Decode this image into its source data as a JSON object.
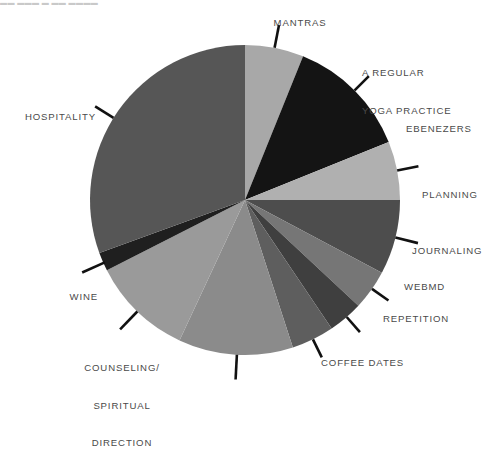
{
  "page": {
    "cut_off_header": "▬▬  ▬▬▬ ▬ ▬▬ ▬▬▬▬"
  },
  "chart_data": {
    "type": "pie",
    "title": "",
    "subtitle": "",
    "xlabel": "",
    "ylabel": "",
    "grid": false,
    "legend_position": "callout-labels",
    "start_angle_deg": 0,
    "direction": "clockwise",
    "center": {
      "x": 245,
      "y": 200
    },
    "radius": 155,
    "categories": [
      "MANTRAS",
      "A REGULAR YOGA PRACTICE",
      "EBENEZERS",
      "PLANNING",
      "JOURNALING",
      "WEBMD",
      "REPETITION",
      "COFFEE DATES",
      "COUNSELING/ SPIRITUAL DIRECTION",
      "WINE",
      "HOSPITALITY"
    ],
    "values": [
      6.1,
      12.8,
      6.1,
      7.8,
      4.2,
      3.6,
      4.4,
      11.9,
      10.6,
      2.0,
      30.5
    ],
    "colors": [
      "#a8a8a8",
      "#141414",
      "#b0b0b0",
      "#4d4d4d",
      "#767676",
      "#3f3f3f",
      "#5e5e5e",
      "#8b8b8b",
      "#9a9a9a",
      "#1f1f1f",
      "#565656"
    ],
    "slices": [
      {
        "label": "MANTRAS",
        "value": 6.1,
        "start_deg": 0.0,
        "end_deg": 22.0,
        "color": "#a8a8a8"
      },
      {
        "label": "A REGULAR YOGA PRACTICE",
        "value": 12.8,
        "start_deg": 22.0,
        "end_deg": 68.0,
        "color": "#141414"
      },
      {
        "label": "EBENEZERS",
        "value": 6.1,
        "start_deg": 68.0,
        "end_deg": 90.0,
        "color": "#b0b0b0"
      },
      {
        "label": "PLANNING",
        "value": 7.8,
        "start_deg": 90.0,
        "end_deg": 118.0,
        "color": "#4d4d4d"
      },
      {
        "label": "JOURNALING",
        "value": 4.2,
        "start_deg": 118.0,
        "end_deg": 133.0,
        "color": "#767676"
      },
      {
        "label": "WEBMD",
        "value": 3.6,
        "start_deg": 133.0,
        "end_deg": 146.0,
        "color": "#3f3f3f"
      },
      {
        "label": "REPETITION",
        "value": 4.4,
        "start_deg": 146.0,
        "end_deg": 162.0,
        "color": "#5e5e5e"
      },
      {
        "label": "COFFEE DATES",
        "value": 11.9,
        "start_deg": 162.0,
        "end_deg": 205.0,
        "color": "#8b8b8b"
      },
      {
        "label": "COUNSELING/ SPIRITUAL DIRECTION",
        "value": 10.6,
        "start_deg": 205.0,
        "end_deg": 243.0,
        "color": "#9a9a9a"
      },
      {
        "label": "WINE",
        "value": 2.0,
        "start_deg": 243.0,
        "end_deg": 250.0,
        "color": "#1f1f1f"
      },
      {
        "label": "HOSPITALITY",
        "value": 30.5,
        "start_deg": 250.0,
        "end_deg": 360.0,
        "color": "#565656"
      }
    ],
    "annotations": [
      {
        "name": "mantras",
        "text": "MANTRAS",
        "align": "center"
      },
      {
        "name": "yoga",
        "text": "A REGULAR\nYOGA PRACTICE",
        "align": "left"
      },
      {
        "name": "ebenezers",
        "text": "EBENEZERS",
        "align": "left"
      },
      {
        "name": "planning",
        "text": "PLANNING",
        "align": "left"
      },
      {
        "name": "journaling",
        "text": "JOURNALING",
        "align": "left"
      },
      {
        "name": "webmd",
        "text": "WEBMD",
        "align": "left"
      },
      {
        "name": "repetition",
        "text": "REPETITION",
        "align": "left"
      },
      {
        "name": "coffee-dates",
        "text": "COFFEE DATES",
        "align": "left"
      },
      {
        "name": "counseling",
        "text": "COUNSELING/\nSPIRITUAL\nDIRECTION",
        "align": "center"
      },
      {
        "name": "wine",
        "text": "WINE",
        "align": "right"
      },
      {
        "name": "hospitality",
        "text": "HOSPITALITY",
        "align": "right"
      }
    ]
  },
  "labels": {
    "mantras": "MANTRAS",
    "yoga_line1": "A REGULAR",
    "yoga_line2": "YOGA PRACTICE",
    "ebenezers": "EBENEZERS",
    "planning": "PLANNING",
    "journaling": "JOURNALING",
    "webmd": "WEBMD",
    "repetition": "REPETITION",
    "coffee_dates": "COFFEE DATES",
    "counseling_line1": "COUNSELING/",
    "counseling_line2": "SPIRITUAL",
    "counseling_line3": "DIRECTION",
    "wine": "WINE",
    "hospitality": "HOSPITALITY"
  },
  "style": {
    "background": "#ffffff",
    "label_color": "#4a4a4a",
    "leader_color": "#111111"
  }
}
